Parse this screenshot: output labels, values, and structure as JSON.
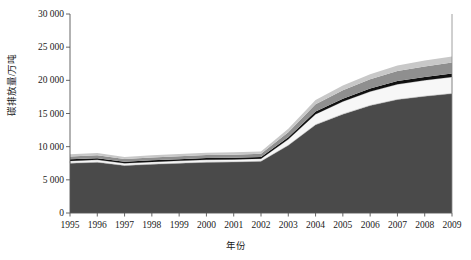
{
  "chart_data": {
    "type": "area",
    "title": "",
    "xlabel": "年份",
    "ylabel": "碳排放量/万吨",
    "categories": [
      "1995",
      "1996",
      "1997",
      "1998",
      "1999",
      "2000",
      "2001",
      "2002",
      "2003",
      "2004",
      "2005",
      "2006",
      "2007",
      "2008",
      "2009"
    ],
    "ylim": [
      0,
      30000
    ],
    "yticks": [
      "0",
      "5 000",
      "10 000",
      "15 000",
      "20 000",
      "25 000",
      "30 000"
    ],
    "ytick_values": [
      0,
      5000,
      10000,
      15000,
      20000,
      25000,
      30000
    ],
    "grid": false,
    "legend": "none",
    "stacked": true,
    "series": [
      {
        "name": "层1",
        "color": "#4a4a4a",
        "values": [
          7500,
          7650,
          7150,
          7350,
          7500,
          7650,
          7700,
          7800,
          10200,
          13300,
          14900,
          16200,
          17100,
          17600,
          18000
        ]
      },
      {
        "name": "层2",
        "color": "#f7f7f7",
        "values": [
          350,
          360,
          340,
          350,
          360,
          370,
          380,
          390,
          900,
          1600,
          1900,
          2100,
          2300,
          2400,
          2500
        ]
      },
      {
        "name": "层3",
        "color": "#111111",
        "values": [
          250,
          250,
          240,
          250,
          250,
          260,
          260,
          270,
          330,
          400,
          440,
          470,
          500,
          520,
          540
        ]
      },
      {
        "name": "层4",
        "color": "#8f8f8f",
        "values": [
          430,
          440,
          420,
          430,
          440,
          450,
          460,
          470,
          760,
          1100,
          1250,
          1380,
          1500,
          1580,
          1650
        ]
      },
      {
        "name": "层5",
        "color": "#c8c8c8",
        "values": [
          320,
          330,
          310,
          320,
          330,
          340,
          340,
          350,
          500,
          650,
          720,
          780,
          840,
          880,
          910
        ]
      }
    ]
  },
  "axes": {
    "x_title": "年份",
    "y_title": "碳排放量/万吨"
  }
}
